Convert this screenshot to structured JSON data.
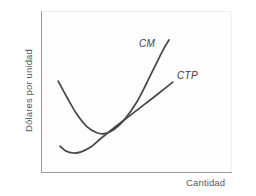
{
  "chart_data": {
    "type": "line",
    "title": "",
    "subtitle": "",
    "xlabel": "Cantidad",
    "ylabel": "Dólares por unidad",
    "grid": false,
    "legend_position": "inline-end-of-curve",
    "axes": {
      "x_ticks": [],
      "y_ticks": [],
      "xlim": [
        0,
        1
      ],
      "ylim": [
        0,
        1
      ],
      "x_axis_arrow": false,
      "y_axis_arrow": false
    },
    "annotations": [
      {
        "name": "cm-curve-label",
        "text": "CM",
        "style": "italic",
        "attached_to": "CM"
      },
      {
        "name": "ctp-curve-label",
        "text": "CTP",
        "style": "italic",
        "attached_to": "CTP"
      }
    ],
    "series": [
      {
        "name": "CM",
        "label": "CM",
        "description": "Curva de costo marginal, forma de U pronunciada",
        "color": "#46464a",
        "points": [
          {
            "x": 0.09,
            "y": 0.565
          },
          {
            "x": 0.14,
            "y": 0.455
          },
          {
            "x": 0.19,
            "y": 0.355
          },
          {
            "x": 0.24,
            "y": 0.282
          },
          {
            "x": 0.29,
            "y": 0.245
          },
          {
            "x": 0.33,
            "y": 0.238
          },
          {
            "x": 0.38,
            "y": 0.262
          },
          {
            "x": 0.44,
            "y": 0.33
          },
          {
            "x": 0.5,
            "y": 0.432
          },
          {
            "x": 0.55,
            "y": 0.545
          },
          {
            "x": 0.6,
            "y": 0.665
          },
          {
            "x": 0.64,
            "y": 0.76
          },
          {
            "x": 0.67,
            "y": 0.82
          }
        ]
      },
      {
        "name": "CTP",
        "label": "CTP",
        "description": "Curva de costo total promedio, forma de U poco profunda",
        "color": "#46464a",
        "points": [
          {
            "x": 0.1,
            "y": 0.16
          },
          {
            "x": 0.13,
            "y": 0.13
          },
          {
            "x": 0.17,
            "y": 0.118
          },
          {
            "x": 0.21,
            "y": 0.125
          },
          {
            "x": 0.26,
            "y": 0.155
          },
          {
            "x": 0.31,
            "y": 0.205
          },
          {
            "x": 0.38,
            "y": 0.272
          },
          {
            "x": 0.46,
            "y": 0.345
          },
          {
            "x": 0.54,
            "y": 0.418
          },
          {
            "x": 0.62,
            "y": 0.492
          },
          {
            "x": 0.69,
            "y": 0.558
          }
        ]
      }
    ],
    "intersections": [
      {
        "name": "cm-crosses-ctp",
        "x": 0.298,
        "y": 0.245,
        "note": "CM corta a CTP en su punto mínimo"
      }
    ]
  }
}
